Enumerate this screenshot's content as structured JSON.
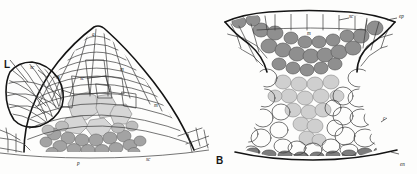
{
  "figure": {
    "caption_absent": true,
    "background_color": "#fdfdfc",
    "ink_color": "#1c1c1c",
    "panels": [
      {
        "id": "A",
        "name": "shoot-apex-longitudinal-section",
        "panel_letter": "",
        "labels": [
          {
            "key": "L",
            "text": "L",
            "x": 6,
            "y": 64
          },
          {
            "key": "sc1",
            "text": "sc",
            "x": 32,
            "y": 68
          },
          {
            "key": "a",
            "text": "a",
            "x": 92,
            "y": 34
          },
          {
            "key": "m1",
            "text": "m",
            "x": 57,
            "y": 78
          },
          {
            "key": "sc2",
            "text": "sc",
            "x": 81,
            "y": 79
          },
          {
            "key": "m2",
            "text": "m",
            "x": 120,
            "y": 70
          },
          {
            "key": "m3",
            "text": "m",
            "x": 155,
            "y": 106
          },
          {
            "key": "p",
            "text": "p",
            "x": 77,
            "y": 164
          },
          {
            "key": "sc3",
            "text": "sc",
            "x": 147,
            "y": 160
          }
        ]
      },
      {
        "id": "B",
        "name": "leaf-cross-section",
        "panel_letter": "B",
        "panel_letter_pos": {
          "x": 216,
          "y": 160
        },
        "labels": [
          {
            "key": "sc",
            "text": "sc",
            "x": 348,
            "y": 17
          },
          {
            "key": "ep",
            "text": "ep",
            "x": 398,
            "y": 17
          },
          {
            "key": "m",
            "text": "m",
            "x": 306,
            "y": 34
          },
          {
            "key": "c",
            "text": "c",
            "x": 382,
            "y": 120
          },
          {
            "key": "en",
            "text": "en",
            "x": 399,
            "y": 165
          }
        ]
      }
    ],
    "legend_keys": [
      {
        "abbr": "a",
        "meaning": "apex"
      },
      {
        "abbr": "m",
        "meaning": "meristem"
      },
      {
        "abbr": "sc",
        "meaning": "sclerenchyma"
      },
      {
        "abbr": "p",
        "meaning": "procambium"
      },
      {
        "abbr": "ep",
        "meaning": "epidermis"
      },
      {
        "abbr": "c",
        "meaning": "cortex"
      },
      {
        "abbr": "en",
        "meaning": "endodermis"
      },
      {
        "abbr": "L",
        "meaning": "leaf primordium"
      }
    ],
    "shading": {
      "light": "#d9d9d9",
      "medium": "#b8b8b8",
      "dark": "#9a9a9a",
      "darker": "#808080",
      "white": "#ffffff"
    }
  }
}
